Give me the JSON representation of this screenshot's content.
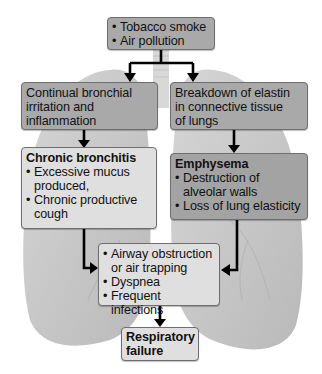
{
  "diagram": {
    "type": "flowchart",
    "colors": {
      "box_dark": "#a9a9a9",
      "box_emphysema": "#a3a3a3",
      "box_light": "#dfdfdf",
      "arrow": "#000000",
      "lung": "#c9c9c9"
    },
    "nodes": {
      "causes": {
        "items": [
          "Tobacco smoke",
          "Air pollution"
        ]
      },
      "irritation": {
        "lines": [
          "Continual bronchial",
          "irritation and",
          "inflammation"
        ]
      },
      "elastin": {
        "lines": [
          "Breakdown of elastin",
          "in connective tissue",
          "of lungs"
        ]
      },
      "bronchitis": {
        "title": "Chronic bronchitis",
        "items": [
          "Excessive mucus produced,",
          "Chronic productive cough"
        ]
      },
      "emphysema": {
        "title": "Emphysema",
        "items": [
          "Destruction of alveolar walls",
          "Loss of lung elasticity"
        ]
      },
      "effects": {
        "items": [
          "Airway obstruction or air trapping",
          "Dyspnea",
          "Frequent infections"
        ]
      },
      "failure": {
        "title_line1": "Respiratory",
        "title_line2": "failure"
      }
    },
    "edges": [
      {
        "from": "causes",
        "to": "irritation"
      },
      {
        "from": "causes",
        "to": "elastin"
      },
      {
        "from": "irritation",
        "to": "bronchitis"
      },
      {
        "from": "elastin",
        "to": "emphysema"
      },
      {
        "from": "bronchitis",
        "to": "effects"
      },
      {
        "from": "emphysema",
        "to": "effects"
      },
      {
        "from": "effects",
        "to": "failure"
      }
    ]
  }
}
